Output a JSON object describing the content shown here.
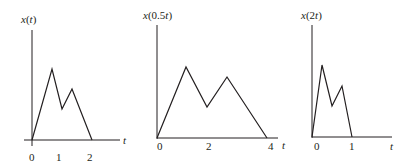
{
  "figure": {
    "panels": [
      {
        "ylabel_fn": "x",
        "ylabel_arg": "t",
        "ylabel_pre": "",
        "xlabel": "t",
        "ticks": [
          "0",
          "1",
          "2"
        ],
        "points": [
          [
            0,
            0
          ],
          [
            0.75,
            0.72
          ],
          [
            1.1,
            0.31
          ],
          [
            1.45,
            0.52
          ],
          [
            2,
            0
          ]
        ]
      },
      {
        "ylabel_fn": "x",
        "ylabel_pre": "0.5",
        "ylabel_arg": "t",
        "xlabel": "t",
        "ticks": [
          "0",
          "2",
          "4"
        ],
        "points": [
          [
            0,
            0
          ],
          [
            1.5,
            0.72
          ],
          [
            2.2,
            0.31
          ],
          [
            2.9,
            0.62
          ],
          [
            4,
            0
          ]
        ]
      },
      {
        "ylabel_fn": "x",
        "ylabel_pre": "2",
        "ylabel_arg": "t",
        "xlabel": "t",
        "ticks": [
          "0",
          "1"
        ],
        "points": [
          [
            0,
            0
          ],
          [
            0.375,
            0.72
          ],
          [
            0.55,
            0.31
          ],
          [
            0.725,
            0.52
          ],
          [
            1,
            0
          ]
        ]
      }
    ]
  },
  "text": {
    "p1_title_a": "x(",
    "p1_title_b": "t",
    "p1_title_c": ")",
    "p2_title_a": "x(0.5",
    "p2_title_b": "t",
    "p2_title_c": ")",
    "p3_title_a": "x(2",
    "p3_title_b": "t",
    "p3_title_c": ")",
    "t": "t",
    "tick0": "0",
    "tick1": "1",
    "tick2": "2",
    "tick4": "4"
  }
}
